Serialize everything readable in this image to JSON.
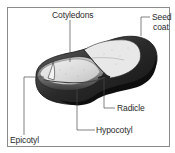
{
  "figure": {
    "type": "labeled-anatomical-diagram",
    "colors": {
      "frame": "#8a8a8a",
      "seed_coat_dark": "#1e1e1e",
      "cotyledon_light": "#e2e2e2",
      "leader_line": "#4a4a4a",
      "text": "#2a2a2a"
    }
  },
  "labels": {
    "cotyledons": "Cotyledons",
    "seed_coat_line1": "Seed",
    "seed_coat_line2": "coat",
    "radicle": "Radicle",
    "hypocotyl": "Hypocotyl",
    "epicotyl": "Epicotyl"
  }
}
